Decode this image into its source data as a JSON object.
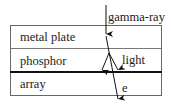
{
  "diagram": {
    "layers": [
      {
        "label": "metal plate"
      },
      {
        "label": "phosphor"
      },
      {
        "label": "array"
      }
    ],
    "annotations": {
      "incoming": "gamma-ray",
      "emitted": "light",
      "electron": "e"
    },
    "colors": {
      "stroke": "#555555",
      "thick_line": "#111111",
      "arrow": "#111111",
      "text": "#222222"
    }
  }
}
